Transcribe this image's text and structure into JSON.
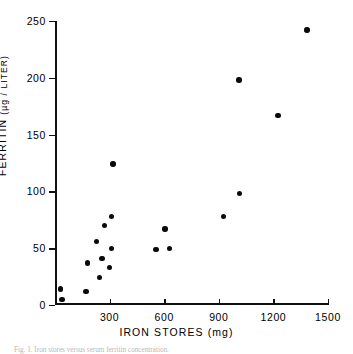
{
  "figure": {
    "title": "",
    "caption": "Fig. 1.  Iron stores versus serum ferritin concentration."
  },
  "axes": {
    "x_title": "IRON STORES (mg)",
    "y_title_main": "FERRITIN",
    "y_title_units": "(µg / LITER)",
    "x_ticks": [
      "300",
      "600",
      "900",
      "1200",
      "1500"
    ],
    "y_ticks": [
      "0",
      "50",
      "100",
      "150",
      "200",
      "250"
    ]
  },
  "chart_data": {
    "type": "scatter",
    "title": "",
    "xlabel": "IRON STORES (mg)",
    "ylabel": "FERRITIN (µg / LITER)",
    "xlim": [
      0,
      1500
    ],
    "ylim": [
      0,
      250
    ],
    "xticks": [
      0,
      300,
      600,
      900,
      1200,
      1500
    ],
    "yticks": [
      0,
      50,
      100,
      150,
      200,
      250
    ],
    "grid": false,
    "legend": null,
    "marker": {
      "shape": "circle",
      "color": "#0a0a0a",
      "size": 5
    },
    "points": [
      {
        "x": 30,
        "y": 14
      },
      {
        "x": 38,
        "y": 5
      },
      {
        "x": 170,
        "y": 12
      },
      {
        "x": 178,
        "y": 37
      },
      {
        "x": 228,
        "y": 56
      },
      {
        "x": 243,
        "y": 24
      },
      {
        "x": 258,
        "y": 41
      },
      {
        "x": 272,
        "y": 70
      },
      {
        "x": 300,
        "y": 33
      },
      {
        "x": 310,
        "y": 50
      },
      {
        "x": 312,
        "y": 78
      },
      {
        "x": 318,
        "y": 124
      },
      {
        "x": 555,
        "y": 49
      },
      {
        "x": 605,
        "y": 67
      },
      {
        "x": 628,
        "y": 50
      },
      {
        "x": 925,
        "y": 78
      },
      {
        "x": 1010,
        "y": 198
      },
      {
        "x": 1015,
        "y": 98
      },
      {
        "x": 1225,
        "y": 167
      },
      {
        "x": 1385,
        "y": 242
      }
    ]
  }
}
